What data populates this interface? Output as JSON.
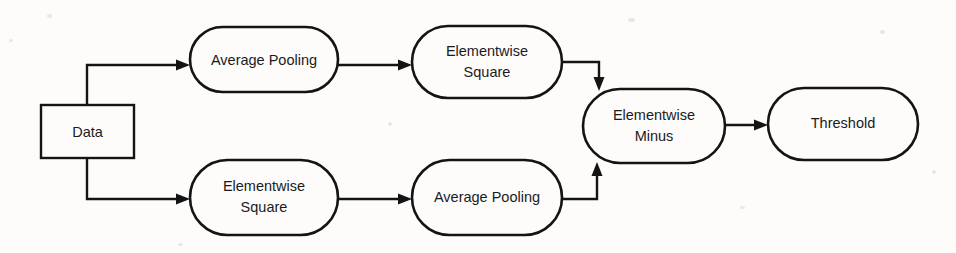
{
  "diagram": {
    "background_color": "#fdfcfb",
    "stroke_color": "#141414",
    "text_color": "#1b1b1b",
    "nodes": [
      {
        "id": "data",
        "label": "Data",
        "shape": "rectangle",
        "x": 41,
        "y": 105,
        "w": 93,
        "h": 53,
        "lines": [
          "Data"
        ]
      },
      {
        "id": "avg-pool-top",
        "label": "Average Pooling",
        "shape": "stadium",
        "x": 190,
        "y": 27,
        "w": 148,
        "h": 65,
        "lines": [
          "Average Pooling"
        ]
      },
      {
        "id": "elem-square-top",
        "label": "Elementwise Square",
        "shape": "stadium",
        "x": 412,
        "y": 26,
        "w": 150,
        "h": 72,
        "lines": [
          "Elementwise",
          "Square"
        ]
      },
      {
        "id": "elem-square-bottom",
        "label": "Elementwise Square",
        "shape": "stadium",
        "x": 190,
        "y": 160,
        "w": 148,
        "h": 75,
        "lines": [
          "Elementwise",
          "Square"
        ]
      },
      {
        "id": "avg-pool-bottom",
        "label": "Average Pooling",
        "shape": "stadium",
        "x": 412,
        "y": 160,
        "w": 150,
        "h": 75,
        "lines": [
          "Average Pooling"
        ]
      },
      {
        "id": "elem-minus",
        "label": "Elementwise Minus",
        "shape": "stadium",
        "x": 583,
        "y": 89,
        "w": 142,
        "h": 74,
        "lines": [
          "Elementwise",
          "Minus"
        ]
      },
      {
        "id": "threshold",
        "label": "Threshold",
        "shape": "stadium",
        "x": 768,
        "y": 88,
        "w": 150,
        "h": 72,
        "lines": [
          "Threshold"
        ]
      }
    ],
    "edges": [
      {
        "id": "data-to-avgpool-top",
        "from": "data",
        "to": "avg-pool-top",
        "path": "M 87 105 L 87 65 L 182 65",
        "arrow": "right",
        "arrow_x": 190,
        "arrow_y": 65
      },
      {
        "id": "data-to-elemsquare-bottom",
        "from": "data",
        "to": "elem-square-bottom",
        "path": "M 87 158 L 87 199 L 182 199",
        "arrow": "right",
        "arrow_x": 190,
        "arrow_y": 199
      },
      {
        "id": "avgpool-top-to-elemsquare-top",
        "from": "avg-pool-top",
        "to": "elem-square-top",
        "path": "M 338 65 L 404 65",
        "arrow": "right",
        "arrow_x": 412,
        "arrow_y": 65
      },
      {
        "id": "elemsquare-bottom-to-avgpool-bottom",
        "from": "elem-square-bottom",
        "to": "avg-pool-bottom",
        "path": "M 337 199 L 404 199",
        "arrow": "right",
        "arrow_x": 412,
        "arrow_y": 199
      },
      {
        "id": "elemsquare-top-to-elemminus",
        "from": "elem-square-top",
        "to": "elem-minus",
        "path": "M 562 62 L 599 62 L 599 81",
        "arrow": "down",
        "arrow_x": 599,
        "arrow_y": 90
      },
      {
        "id": "avgpool-bottom-to-elemminus",
        "from": "avg-pool-bottom",
        "to": "elem-minus",
        "path": "M 562 199 L 597 199 L 597 172",
        "arrow": "up",
        "arrow_x": 597,
        "arrow_y": 163
      },
      {
        "id": "elemminus-to-threshold",
        "from": "elem-minus",
        "to": "threshold",
        "path": "M 725 125 L 760 125",
        "arrow": "right",
        "arrow_x": 768,
        "arrow_y": 125
      }
    ]
  }
}
